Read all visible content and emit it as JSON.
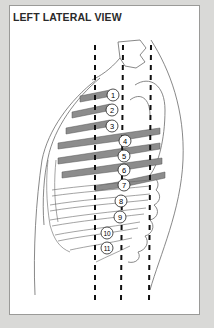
{
  "title": "LEFT LATERAL VIEW",
  "colors": {
    "background": "#d9d9d7",
    "panel": "#ffffff",
    "panel_border": "#9a9a98",
    "rib_fill": "#8c8c8c",
    "outline": "#555555",
    "dash": "#111111"
  },
  "diagram": {
    "guide_lines": [
      {
        "name": "anterior-axillary-line",
        "x": 95
      },
      {
        "name": "mid-axillary-line",
        "x": 123
      },
      {
        "name": "posterior-axillary-line",
        "x": 151
      }
    ],
    "markers": [
      {
        "label": "1",
        "x": 113,
        "y": 95
      },
      {
        "label": "2",
        "x": 112,
        "y": 110
      },
      {
        "label": "3",
        "x": 112,
        "y": 126
      },
      {
        "label": "4",
        "x": 125,
        "y": 141
      },
      {
        "label": "5",
        "x": 124,
        "y": 156
      },
      {
        "label": "6",
        "x": 124,
        "y": 170
      },
      {
        "label": "7",
        "x": 124,
        "y": 185
      },
      {
        "label": "8",
        "x": 121,
        "y": 201
      },
      {
        "label": "9",
        "x": 120,
        "y": 217
      },
      {
        "label": "10",
        "x": 107,
        "y": 233
      },
      {
        "label": "11",
        "x": 107,
        "y": 248
      }
    ]
  }
}
